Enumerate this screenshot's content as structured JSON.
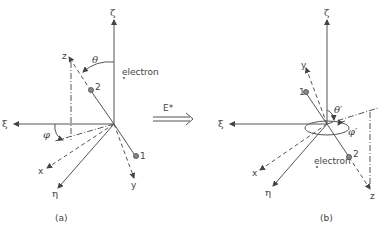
{
  "panel_a": {
    "caption": "(a)",
    "axes": {
      "zeta": "ζ",
      "xi": "ξ",
      "eta": "η",
      "x": "x",
      "y": "y",
      "z": "z"
    },
    "angles": {
      "theta": "θ",
      "phi": "φ"
    },
    "particles": {
      "p1": "1",
      "p2": "2",
      "electron": "electron"
    }
  },
  "transition": {
    "label": "E*"
  },
  "panel_b": {
    "caption": "(b)",
    "axes": {
      "zeta": "ζ",
      "xi": "ξ",
      "eta": "η",
      "x": "x",
      "y": "y",
      "z": "z"
    },
    "angles": {
      "theta": "θ′",
      "phi": "φ′"
    },
    "particles": {
      "p1": "1",
      "p2": "2",
      "electron": "electron"
    }
  },
  "colors": {
    "ink": "#444444",
    "background": "#ffffff"
  }
}
